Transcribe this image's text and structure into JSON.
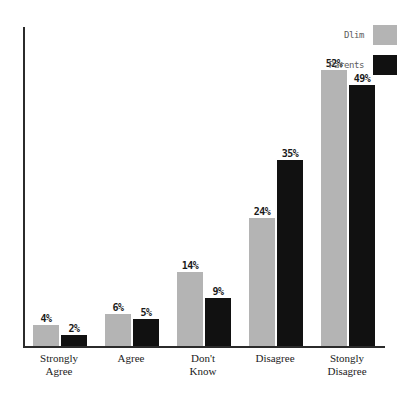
{
  "chart_data": {
    "type": "bar",
    "title": "",
    "subtitle": "",
    "xlabel": "",
    "ylabel": "",
    "ylim": [
      0,
      60
    ],
    "grid": false,
    "legend_position": "top-right",
    "categories": [
      "Strongly Agree",
      "Agree",
      "Don't Know",
      "Disagree",
      "Stongly Disagree"
    ],
    "category_lines": [
      [
        "Strongly",
        "Agree"
      ],
      [
        "Agree",
        ""
      ],
      [
        "Don't",
        "Know"
      ],
      [
        "Disagree",
        ""
      ],
      [
        "Stongly",
        "Disagree"
      ]
    ],
    "series": [
      {
        "name": "Dlim",
        "color": "#b4b4b4",
        "values": [
          4,
          6,
          14,
          24,
          52
        ],
        "labels": [
          "4%",
          "6%",
          "14%",
          "24%",
          "52%"
        ]
      },
      {
        "name": "Parents",
        "color": "#111111",
        "values": [
          2,
          5,
          9,
          35,
          49
        ],
        "labels": [
          "2%",
          "5%",
          "9%",
          "35%",
          "49%"
        ]
      }
    ]
  },
  "axes": {
    "axis_color": "#2b2b2b"
  }
}
